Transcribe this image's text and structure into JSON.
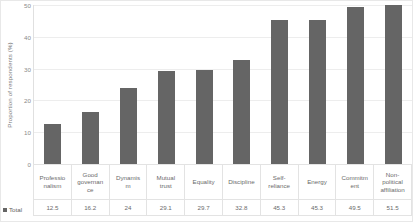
{
  "chart_data": {
    "type": "bar",
    "title": "",
    "xlabel": "",
    "ylabel": "Proportion of respondents (%)",
    "ylim": [
      0,
      50
    ],
    "yticks": [
      50,
      40,
      30,
      20,
      10,
      0
    ],
    "grid": true,
    "legend_position": "bottom-left-table",
    "categories": [
      "Professionalism",
      "Good governance",
      "Dynamism",
      "Mutual trust",
      "Equality",
      "Discipline",
      "Self-reliance",
      "Energy",
      "Commitment",
      "Non-political affiliation"
    ],
    "series": [
      {
        "name": "Total",
        "color": "#656565",
        "values": [
          12.5,
          16.2,
          24,
          29.1,
          29.7,
          32.8,
          45.3,
          45.3,
          49.5,
          51.5
        ]
      }
    ]
  },
  "table": {
    "legend_label": "Total",
    "legend_marker": "square-marker",
    "category_labels": [
      "Professio\nnalism",
      "Good\ngovernan\nce",
      "Dynamis\nm",
      "Mutual\ntrust",
      "Equality",
      "Discipline",
      "Self-\nreliance",
      "Energy",
      "Commitm\nent",
      "Non-\npolitical\naffiliation"
    ],
    "value_labels": [
      "12.5",
      "16.2",
      "24",
      "29.1",
      "29.7",
      "32.8",
      "45.3",
      "45.3",
      "49.5",
      "51.5"
    ]
  },
  "style": {
    "bar_color": "#656565",
    "gridline_color": "#ededed",
    "text_color": "#7b7b7b",
    "border_color": "#e8e8e8"
  }
}
